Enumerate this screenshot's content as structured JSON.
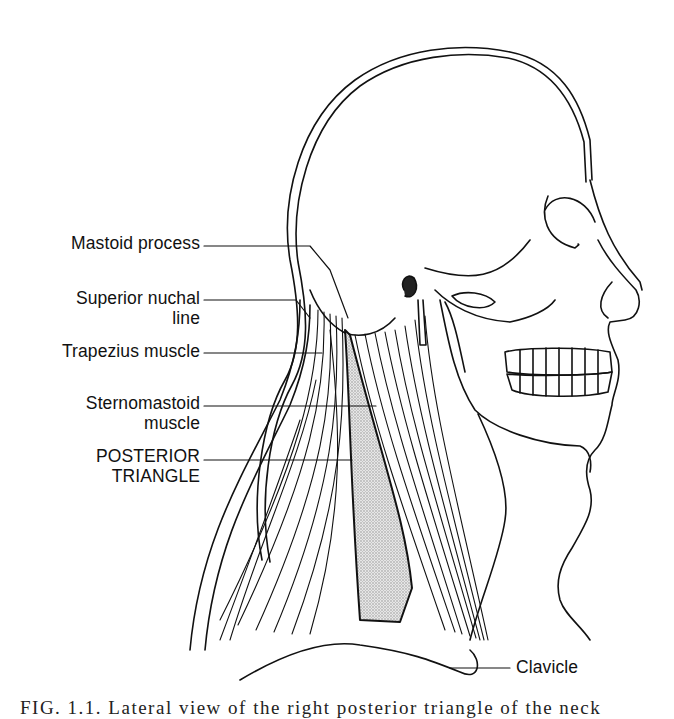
{
  "figure": {
    "labels": {
      "mastoid_process": "Mastoid process",
      "superior_nuchal_line_1": "Superior nuchal",
      "superior_nuchal_line_2": "line",
      "trapezius_muscle": "Trapezius muscle",
      "sternomastoid_muscle_1": "Sternomastoid",
      "sternomastoid_muscle_2": "muscle",
      "posterior_triangle_1": "POSTERIOR",
      "posterior_triangle_2": "TRIANGLE",
      "clavicle": "Clavicle"
    },
    "caption": "FIG. 1.1. Lateral view of the right posterior triangle of the neck",
    "colors": {
      "ink": "#111111",
      "stipple": "#cfcfcf",
      "background": "#ffffff"
    }
  }
}
